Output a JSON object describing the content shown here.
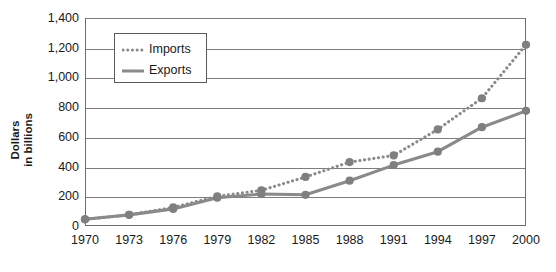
{
  "chart_data": {
    "type": "line",
    "title": "",
    "xlabel": "",
    "ylabel": "Dollars in billions",
    "ylim": [
      0,
      1400
    ],
    "ytick_labels": [
      "1,400",
      "1,200",
      "1,000",
      "800",
      "600",
      "400",
      "200",
      "0"
    ],
    "ytick_values": [
      1400,
      1200,
      1000,
      800,
      600,
      400,
      200,
      0
    ],
    "grid": true,
    "legend_position": "upper-left-inset",
    "categories": [
      1970,
      1973,
      1976,
      1979,
      1982,
      1985,
      1988,
      1991,
      1994,
      1997,
      2000
    ],
    "xtick_labels": [
      "1970",
      "1973",
      "1976",
      "1979",
      "1982",
      "1985",
      "1988",
      "1991",
      "1994",
      "1997",
      "2000"
    ],
    "series": [
      {
        "name": "Imports",
        "style": "dotted",
        "color": "#8a8a8a",
        "values": [
          45,
          75,
          125,
          200,
          240,
          330,
          430,
          475,
          650,
          860,
          1220
        ]
      },
      {
        "name": "Exports",
        "style": "solid",
        "color": "#8a8a8a",
        "values": [
          45,
          75,
          115,
          190,
          215,
          210,
          305,
          410,
          500,
          665,
          775
        ]
      }
    ]
  },
  "axis": {
    "y_title_line1": "Dollars",
    "y_title_line2": "in billions"
  },
  "legend": {
    "items": [
      {
        "label": "Imports",
        "swatch": "dotted-line-icon"
      },
      {
        "label": "Exports",
        "swatch": "solid-line-icon"
      }
    ]
  },
  "colors": {
    "series": "#8a8a8a",
    "marker": "#7f7f7f",
    "grid": "#7d7d7d",
    "frame": "#6e6e6e",
    "text": "#1a1a1a"
  }
}
